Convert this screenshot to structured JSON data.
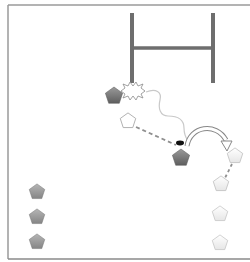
{
  "diagram": {
    "colors": {
      "frame": "#8a8a8a",
      "goal_posts": "#6e6e6e",
      "attacker_fill": "#7a7a7a",
      "defender_fill": "#f6f6f6",
      "defender_stroke": "#b8b8b8",
      "waiting_fill": "#9a9a9a",
      "path": "#c9c9c9",
      "pass_line": "#8f8f8f",
      "ball": "#111111"
    },
    "goal_posts": {
      "left_post": {
        "x": 132,
        "y1": 13,
        "y2": 83
      },
      "right_post": {
        "x": 213,
        "y1": 13,
        "y2": 83
      },
      "crossbar": {
        "y": 48,
        "x1": 132,
        "x2": 213
      }
    },
    "players": [
      {
        "id": "attacker-tackled",
        "type": "attacker",
        "x": 114,
        "y": 96
      },
      {
        "id": "support-open",
        "type": "defender",
        "x": 128,
        "y": 121
      },
      {
        "id": "attacker-ball-carrier",
        "type": "attacker",
        "x": 181,
        "y": 158
      },
      {
        "id": "receiver-1",
        "type": "defender",
        "x": 235,
        "y": 156
      },
      {
        "id": "receiver-2",
        "type": "defender",
        "x": 221,
        "y": 184
      },
      {
        "id": "queue-right-1",
        "type": "defender",
        "x": 220,
        "y": 214
      },
      {
        "id": "queue-right-2",
        "type": "defender",
        "x": 220,
        "y": 243
      },
      {
        "id": "queue-left-1",
        "type": "waiting",
        "x": 37,
        "y": 192
      },
      {
        "id": "queue-left-2",
        "type": "waiting",
        "x": 37,
        "y": 217
      },
      {
        "id": "queue-left-3",
        "type": "waiting",
        "x": 37,
        "y": 242
      }
    ],
    "contact_burst": {
      "x": 133,
      "y": 91
    },
    "ball": {
      "x": 180,
      "y": 143
    },
    "icons": [
      "pentagon-player-icon",
      "burst-contact-icon",
      "ball-icon",
      "curved-arrow-icon"
    ]
  }
}
